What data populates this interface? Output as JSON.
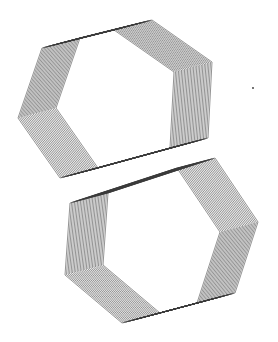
{
  "figure": {
    "title": "",
    "line_color": "#3a3a3a",
    "background": "#ffffff",
    "copies": 26,
    "shapes": [
      {
        "name": "upper-hexagon-ribbon",
        "sides": 6
      },
      {
        "name": "lower-hexagon-ribbon",
        "sides": 6
      }
    ]
  }
}
